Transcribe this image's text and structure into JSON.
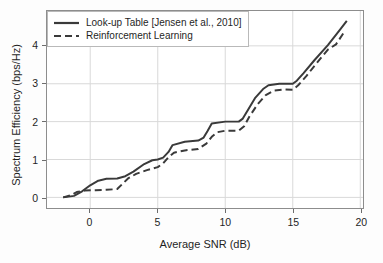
{
  "chart_data": {
    "type": "line",
    "title": "",
    "subtitle": "",
    "xlabel": "Average SNR (dB)",
    "ylabel": "Spectrum Efficiency (bps/Hz)",
    "xlim": [
      -3.2,
      20.2
    ],
    "ylim": [
      -0.28,
      4.92
    ],
    "xticks": [
      0,
      5,
      10,
      15,
      20
    ],
    "yticks": [
      0,
      1,
      2,
      3,
      4
    ],
    "xtick_labels": [
      "0",
      "5",
      "10",
      "15",
      "20"
    ],
    "ytick_labels": [
      "0",
      "1",
      "2",
      "3",
      "4"
    ],
    "grid": true,
    "grid_color": "#d9d9d9",
    "legend_position": "upper left",
    "frame_color": "#8d8d8d",
    "background": "#ffffff",
    "series": [
      {
        "name": "Look-up Table [Jensen et al., 2010]",
        "style": "solid",
        "color": "#3a3a3a",
        "width": 2.0,
        "x": [
          -2.0,
          -1.2,
          -0.6,
          0.0,
          0.6,
          1.2,
          2.0,
          2.6,
          3.2,
          4.0,
          4.6,
          5.0,
          5.4,
          5.8,
          6.1,
          7.0,
          8.0,
          8.4,
          8.7,
          9.0,
          10.0,
          11.0,
          11.3,
          11.7,
          12.2,
          12.8,
          13.2,
          14.0,
          15.0,
          15.3,
          15.8,
          16.6,
          17.6,
          18.4,
          19.0
        ],
        "y": [
          0.0,
          0.04,
          0.16,
          0.32,
          0.44,
          0.49,
          0.5,
          0.56,
          0.68,
          0.88,
          0.98,
          1.0,
          1.05,
          1.2,
          1.38,
          1.47,
          1.5,
          1.58,
          1.76,
          1.95,
          2.0,
          2.0,
          2.08,
          2.32,
          2.62,
          2.86,
          2.96,
          3.0,
          3.0,
          3.08,
          3.28,
          3.62,
          4.02,
          4.38,
          4.66
        ]
      },
      {
        "name": "Reinforcement Learning",
        "style": "dashed",
        "color": "#3a3a3a",
        "width": 2.0,
        "x": [
          -2.0,
          -1.4,
          -1.0,
          -0.4,
          0.4,
          1.2,
          2.0,
          2.4,
          2.8,
          3.4,
          4.2,
          5.0,
          5.4,
          5.8,
          6.2,
          7.0,
          8.0,
          8.6,
          9.0,
          9.4,
          10.0,
          11.0,
          11.4,
          11.8,
          12.4,
          13.0,
          13.6,
          14.4,
          15.0,
          15.4,
          16.0,
          16.8,
          17.6,
          18.2,
          18.8
        ],
        "y": [
          0.0,
          0.06,
          0.14,
          0.18,
          0.19,
          0.2,
          0.22,
          0.36,
          0.5,
          0.62,
          0.72,
          0.8,
          0.9,
          1.06,
          1.18,
          1.24,
          1.28,
          1.42,
          1.6,
          1.72,
          1.76,
          1.76,
          1.88,
          2.14,
          2.46,
          2.7,
          2.82,
          2.85,
          2.84,
          2.96,
          3.2,
          3.56,
          3.9,
          4.04,
          4.36
        ]
      }
    ]
  },
  "legend": {
    "entries": [
      {
        "label": "Look-up Table [Jensen et al., 2010]",
        "style": "solid"
      },
      {
        "label": "Reinforcement Learning",
        "style": "dashed"
      }
    ]
  }
}
